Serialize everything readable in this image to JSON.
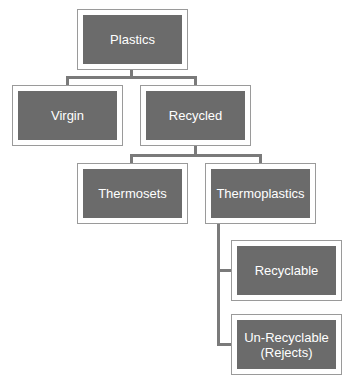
{
  "diagram": {
    "type": "hierarchy",
    "colors": {
      "node_fill": "#6b6b6b",
      "node_text": "#ffffff",
      "node_frame": "#9a9a9a",
      "connector": "#7a7a7a",
      "background": "#ffffff"
    },
    "nodes": {
      "plastics": {
        "label": "Plastics"
      },
      "virgin": {
        "label": "Virgin"
      },
      "recycled": {
        "label": "Recycled"
      },
      "thermosets": {
        "label": "Thermosets"
      },
      "thermoplastics": {
        "label": "Thermoplastics"
      },
      "recyclable": {
        "label": "Recyclable"
      },
      "unrecyclable": {
        "label": "Un-Recyclable (Rejects)"
      }
    },
    "edges": [
      {
        "from": "Plastics",
        "to": "Virgin"
      },
      {
        "from": "Plastics",
        "to": "Recycled"
      },
      {
        "from": "Recycled",
        "to": "Thermosets"
      },
      {
        "from": "Recycled",
        "to": "Thermoplastics"
      },
      {
        "from": "Thermoplastics",
        "to": "Recyclable"
      },
      {
        "from": "Thermoplastics",
        "to": "Un-Recyclable (Rejects)"
      }
    ]
  }
}
